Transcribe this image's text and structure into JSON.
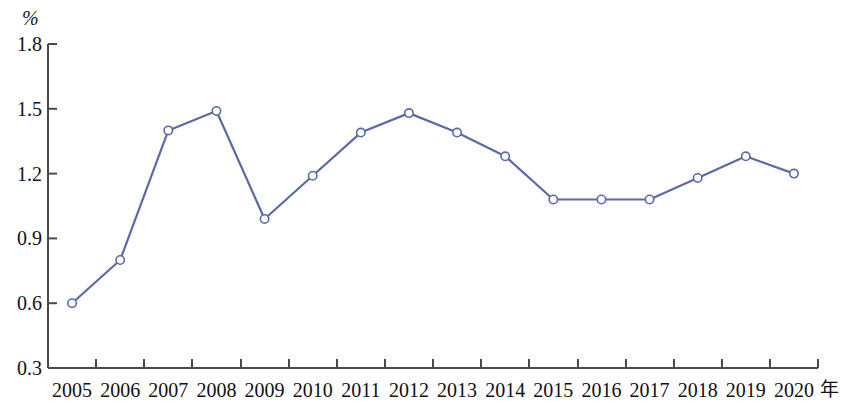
{
  "chart_data": {
    "type": "line",
    "title": "",
    "subtitle": "",
    "xlabel": "年",
    "ylabel": "%",
    "categories": [
      "2005",
      "2006",
      "2007",
      "2008",
      "2009",
      "2010",
      "2011",
      "2012",
      "2013",
      "2014",
      "2015",
      "2016",
      "2017",
      "2018",
      "2019",
      "2020"
    ],
    "x": [
      2005,
      2006,
      2007,
      2008,
      2009,
      2010,
      2011,
      2012,
      2013,
      2014,
      2015,
      2016,
      2017,
      2018,
      2019,
      2020
    ],
    "values": [
      0.6,
      0.8,
      1.4,
      1.49,
      0.99,
      1.19,
      1.39,
      1.48,
      1.39,
      1.28,
      1.08,
      1.08,
      1.08,
      1.18,
      1.28,
      1.2
    ],
    "series": [
      {
        "name": "",
        "values": [
          0.6,
          0.8,
          1.4,
          1.49,
          0.99,
          1.19,
          1.39,
          1.48,
          1.39,
          1.28,
          1.08,
          1.08,
          1.08,
          1.18,
          1.28,
          1.2
        ]
      }
    ],
    "ylim": [
      0.3,
      1.8
    ],
    "yticks": [
      "0.3",
      "0.6",
      "0.9",
      "1.2",
      "1.5",
      "1.8"
    ],
    "ytick_values": [
      0.3,
      0.6,
      0.9,
      1.2,
      1.5,
      1.8
    ],
    "grid": false,
    "legend": "none",
    "line_color": "#5a6aa6",
    "marker": "open-circle",
    "marker_fill": "#ffffff",
    "axis_color": "#4a4a4a"
  },
  "axes": {
    "y_unit": "%",
    "x_unit": "年"
  }
}
